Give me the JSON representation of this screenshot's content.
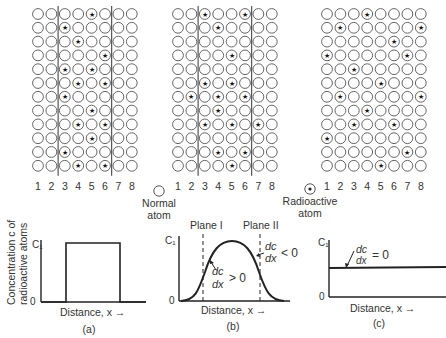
{
  "figure": {
    "grids": [
      {
        "id": "a",
        "origin_x": 38,
        "origin_y": 14,
        "boundaries_after_columns": [
          2,
          6
        ],
        "column_labels": [
          "1",
          "2",
          "3",
          "4",
          "5",
          "6",
          "7",
          "8"
        ],
        "radioactive_rows": [
          [
            5
          ],
          [
            3
          ],
          [
            4
          ],
          [
            6
          ],
          [
            3,
            5
          ],
          [
            4,
            6
          ],
          [
            3
          ],
          [
            5
          ],
          [
            4,
            6
          ],
          [
            5
          ],
          [
            3
          ],
          [
            4,
            6
          ]
        ]
      },
      {
        "id": "b",
        "origin_x": 178,
        "origin_y": 14,
        "boundaries_after_columns": [
          2,
          6
        ],
        "column_labels": [
          "1",
          "2",
          "3",
          "4",
          "5",
          "6",
          "7",
          "8"
        ],
        "radioactive_rows": [
          [
            3,
            6
          ],
          [
            4
          ],
          [],
          [
            5
          ],
          [],
          [
            3,
            5
          ],
          [
            2,
            4,
            6
          ],
          [
            4
          ],
          [
            3,
            5,
            7
          ],
          [],
          [
            4,
            6
          ],
          [
            5
          ]
        ]
      },
      {
        "id": "c",
        "origin_x": 327,
        "origin_y": 14,
        "boundaries_after_columns": [],
        "column_labels": [
          "1",
          "2",
          "3",
          "4",
          "5",
          "6",
          "7",
          "8"
        ],
        "radioactive_rows": [
          [
            4
          ],
          [
            2,
            8
          ],
          [
            6
          ],
          [
            1,
            7
          ],
          [
            3
          ],
          [
            5
          ],
          [
            2,
            8
          ],
          [
            4
          ],
          [
            3,
            6
          ],
          [
            1
          ],
          [
            7
          ],
          [
            5
          ]
        ]
      }
    ],
    "legend": {
      "normal": {
        "line1": "Normal",
        "line2": "atom"
      },
      "radioactive": {
        "line1": "Radioactive",
        "line2": "atom"
      }
    },
    "plots": {
      "y_axis_title_line1": "Concentration c of",
      "y_axis_title_line2": "radioactive atoms",
      "a": {
        "y_top": "C₁",
        "y_zero": "0",
        "x_label": "Distance, x →",
        "caption": "(a)"
      },
      "b": {
        "y_top": "C₁",
        "y_zero": "0",
        "x_label": "Distance, x →",
        "caption": "(b)",
        "plane1": "Plane I",
        "plane2": "Plane II",
        "grad_pos_num": "dc",
        "grad_pos_den": "dx",
        "grad_pos_rel": "> 0",
        "grad_neg_num": "dc",
        "grad_neg_den": "dx",
        "grad_neg_rel": "< 0"
      },
      "c": {
        "y_top": "C₁",
        "y_zero": "0",
        "x_label": "Distance, x →",
        "caption": "(c)",
        "grad_num": "dc",
        "grad_den": "dx",
        "grad_rel": "= 0"
      }
    }
  }
}
